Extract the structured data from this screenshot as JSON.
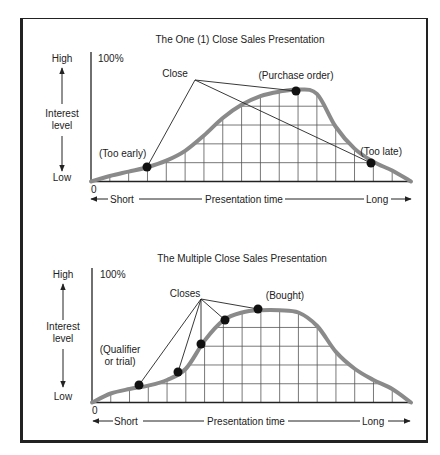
{
  "figure": {
    "panels": [
      {
        "title": "The One (1) Close Sales Presentation",
        "y_axis": {
          "high": "High",
          "low": "Low",
          "label_line1": "Interest",
          "label_line2": "level",
          "max_label": "100%"
        },
        "x_axis": {
          "origin": "0",
          "short": "Short",
          "label": "Presentation time",
          "long": "Long"
        },
        "callout": "Close",
        "annotations": [
          "(Too early)",
          "(Purchase order)",
          "(Too late)"
        ]
      },
      {
        "title": "The Multiple Close Sales Presentation",
        "y_axis": {
          "high": "High",
          "low": "Low",
          "label_line1": "Interest",
          "label_line2": "level",
          "max_label": "100%"
        },
        "x_axis": {
          "origin": "0",
          "short": "Short",
          "label": "Presentation time",
          "long": "Long"
        },
        "callout": "Closes",
        "annotations": [
          "(Qualifier",
          "or trial)",
          "(Bought)"
        ]
      }
    ],
    "colors": {
      "curve": "#8a8a8a",
      "grid": "#555555",
      "ink": "#222222"
    }
  },
  "chart_data": [
    {
      "type": "line",
      "title": "The One (1) Close Sales Presentation",
      "xlabel": "Presentation time (Short → Long)",
      "ylabel": "Interest level (Low → High)",
      "ylim": [
        0,
        100
      ],
      "x": [
        0,
        1,
        2,
        3,
        4,
        5,
        6,
        7,
        8,
        9,
        10,
        11,
        12,
        13,
        14,
        15,
        16,
        17
      ],
      "series": [
        {
          "name": "Interest",
          "values": [
            0,
            5,
            9,
            13,
            19,
            28,
            42,
            58,
            70,
            78,
            82,
            84,
            80,
            50,
            30,
            18,
            10,
            0
          ]
        }
      ],
      "close_points": [
        {
          "label": "(Too early)",
          "x": 3,
          "y": 14
        },
        {
          "label": "(Purchase order)",
          "x": 11,
          "y": 84
        },
        {
          "label": "(Too late)",
          "x": 15,
          "y": 17
        }
      ],
      "grid": true
    },
    {
      "type": "line",
      "title": "The Multiple Close Sales Presentation",
      "xlabel": "Presentation time (Short → Long)",
      "ylabel": "Interest level (Low → High)",
      "ylim": [
        0,
        100
      ],
      "x": [
        0,
        1,
        2,
        3,
        4,
        5,
        6,
        7,
        8,
        9,
        10,
        11,
        12,
        13,
        14,
        15,
        16,
        17
      ],
      "series": [
        {
          "name": "Interest",
          "values": [
            0,
            8,
            12,
            15,
            20,
            30,
            55,
            73,
            80,
            82,
            82,
            80,
            68,
            45,
            30,
            20,
            12,
            0
          ]
        }
      ],
      "close_points": [
        {
          "label": "(Qualifier or trial)",
          "x": 2.5,
          "y": 16
        },
        {
          "label": "Close 2",
          "x": 4.6,
          "y": 28
        },
        {
          "label": "Close 3",
          "x": 5.8,
          "y": 52
        },
        {
          "label": "Close 4",
          "x": 7.1,
          "y": 74
        },
        {
          "label": "(Bought)",
          "x": 8.8,
          "y": 83
        }
      ],
      "grid": true
    }
  ]
}
